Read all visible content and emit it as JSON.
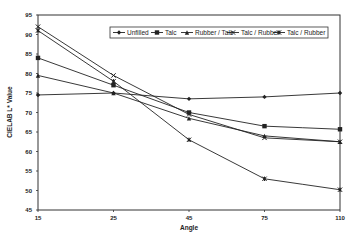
{
  "chart_data": {
    "type": "line",
    "title": "",
    "xlabel": "Angle",
    "ylabel": "CIELAB L* Value",
    "categories": [
      "15",
      "25",
      "45",
      "75",
      "110"
    ],
    "ylim": [
      45,
      95
    ],
    "yticks": [
      45,
      50,
      55,
      60,
      65,
      70,
      75,
      80,
      85,
      90,
      95
    ],
    "grid": false,
    "legend_position": "top-right inside",
    "series": [
      {
        "name": "Unfilled",
        "marker": "diamond",
        "values": [
          74.5,
          75.0,
          73.5,
          74.0,
          75.0
        ]
      },
      {
        "name": "Talc",
        "marker": "square",
        "values": [
          84.0,
          77.0,
          70.0,
          66.5,
          65.7
        ]
      },
      {
        "name": "Rubber / Talc",
        "marker": "triangle",
        "values": [
          79.5,
          75.0,
          68.5,
          64.0,
          62.5
        ]
      },
      {
        "name": "Talc / Rubber",
        "marker": "x",
        "values": [
          92.0,
          79.5,
          69.5,
          63.5,
          62.5
        ]
      },
      {
        "name": "Talc / Rubber",
        "marker": "asterisk",
        "values": [
          91.0,
          78.0,
          63.0,
          53.0,
          50.2
        ]
      }
    ]
  }
}
